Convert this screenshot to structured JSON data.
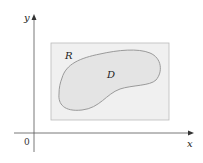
{
  "figure": {
    "width": 203,
    "height": 163,
    "background": "#ffffff"
  },
  "axes": {
    "x_label": "x",
    "y_label": "y",
    "origin_label": "0",
    "color": "#555555"
  },
  "rectangle": {
    "label": "R",
    "x": 51,
    "y": 43,
    "width": 118,
    "height": 77,
    "fill": "#f0f0f0",
    "stroke": "#bbbbbb"
  },
  "region": {
    "label": "D",
    "fill": "#e4e4e4",
    "stroke": "#9a9a9a"
  },
  "colors": {
    "text": "#222222",
    "axis": "#555555"
  }
}
